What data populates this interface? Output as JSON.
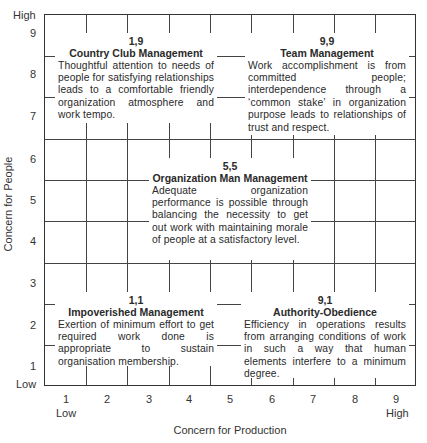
{
  "y_axis": {
    "label": "Concern for People",
    "high_label": "High",
    "low_label": "Low",
    "ticks": [
      "9",
      "8",
      "7",
      "6",
      "5",
      "4",
      "3",
      "2",
      "1"
    ]
  },
  "x_axis": {
    "label": "Concern for Production",
    "low_label": "Low",
    "high_label": "High",
    "ticks": [
      "1",
      "2",
      "3",
      "4",
      "5",
      "6",
      "7",
      "8",
      "9"
    ]
  },
  "styles": {
    "country_club": {
      "coord": "1,9",
      "title": "Country Club Management",
      "description": "Thoughtful attention to needs of people for satisfying relationships leads to a comfortable friendly organization atmosphere and work tempo."
    },
    "team": {
      "coord": "9,9",
      "title": "Team Management",
      "description": "Work accomplishment is from committed people; interdependence through a ‘common stake’ in organization purpose leads to relationships of trust and respect."
    },
    "organization_man": {
      "coord": "5,5",
      "title": "Organization Man Management",
      "description": "Adequate organization performance is possible through balancing the necessity to get out work with maintaining morale of people at a satisfactory level."
    },
    "impoverished": {
      "coord": "1,1",
      "title": "Impoverished Management",
      "description": "Exertion of minimum effort to get required work done is appropriate to sustain organisation membership."
    },
    "authority_obedience": {
      "coord": "9,1",
      "title": "Authority-Obedience",
      "description": "Efficiency in operations results from arranging conditions of work in such a way that human elements interfere to a minimum degree."
    }
  }
}
